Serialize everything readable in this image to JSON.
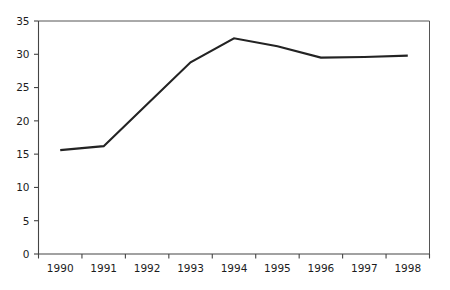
{
  "chart_data": {
    "type": "line",
    "title": "",
    "subtitle": "",
    "xlabel": "",
    "ylabel": "",
    "categories": [
      "1990",
      "1991",
      "1992",
      "1993",
      "1994",
      "1995",
      "1996",
      "1997",
      "1998"
    ],
    "x": [
      1990,
      1991,
      1992,
      1993,
      1994,
      1995,
      1996,
      1997,
      1998
    ],
    "values": [
      15.6,
      16.2,
      22.5,
      28.8,
      32.4,
      31.2,
      29.5,
      29.6,
      29.8
    ],
    "series": [
      {
        "name": "",
        "values": [
          15.6,
          16.2,
          22.5,
          28.8,
          32.4,
          31.2,
          29.5,
          29.6,
          29.8
        ],
        "color": "#232323"
      }
    ],
    "ylim": [
      0,
      35
    ],
    "y_ticks": [
      0,
      5,
      10,
      15,
      20,
      25,
      30,
      35
    ],
    "y_tick_labels": [
      "0",
      "5",
      "10",
      "15",
      "20",
      "25",
      "30",
      "35"
    ],
    "x_tick_labels": [
      "1990",
      "1991",
      "1992",
      "1993",
      "1994",
      "1995",
      "1996",
      "1997",
      "1998"
    ],
    "grid": false,
    "legend": false,
    "legend_position": "none",
    "annotations": [],
    "frame": {
      "top": true,
      "right": true,
      "left": true,
      "bottom": true
    },
    "colors": {
      "line": "#232323",
      "axis": "#444444",
      "frame": "#555555",
      "text": "#1c1c1c",
      "background": "#ffffff"
    }
  }
}
